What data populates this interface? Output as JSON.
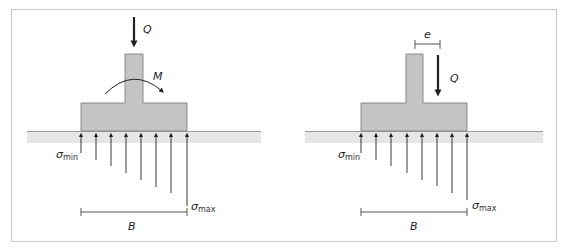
{
  "figure": {
    "colors": {
      "frame": "#c8c8c8",
      "footing_fill": "#c4c4c4",
      "footing_stroke": "#8a8a8a",
      "ground_fill": "#e6e6e6",
      "ground_line": "#9a9a9a",
      "arrows": "#222222"
    }
  },
  "left_diagram": {
    "load_label": "Q",
    "moment_label": "M",
    "sigma_min": {
      "symbol": "σ",
      "subscript": "min"
    },
    "sigma_max": {
      "symbol": "σ",
      "subscript": "max"
    },
    "width_label": "B",
    "pressure_arrow_count": 8
  },
  "right_diagram": {
    "eccentricity_label": "e",
    "load_label": "Q",
    "sigma_min": {
      "symbol": "σ",
      "subscript": "min"
    },
    "sigma_max": {
      "symbol": "σ",
      "subscript": "max"
    },
    "width_label": "B",
    "pressure_arrow_count": 8
  }
}
